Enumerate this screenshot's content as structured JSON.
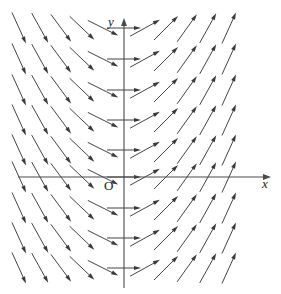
{
  "figure": {
    "title": "",
    "background_color": "#ffffff",
    "stroke_color": "#3a3a3a",
    "axis_color": "#4a4a4a",
    "width": 281,
    "height": 294
  },
  "axes": {
    "x_label": "x",
    "y_label": "y",
    "origin_label": "O",
    "x_axis_y_px": 177,
    "y_axis_x_px": 124,
    "x_axis_start_px": 18,
    "x_axis_end_px": 271,
    "y_axis_top_px": 18,
    "y_axis_bottom_px": 288
  },
  "chart_data": {
    "type": "scatter",
    "subtype": "direction-field",
    "title": "",
    "xlabel": "x",
    "ylabel": "y",
    "grid": false,
    "legend": null,
    "slope_rule": "dy/dx = x",
    "x": [
      -5,
      -4,
      -3,
      -2,
      -1,
      0,
      1,
      2,
      3,
      4,
      5
    ],
    "y": [
      5,
      4,
      3,
      2,
      1,
      0,
      -1,
      -2,
      -3,
      -4,
      -5
    ],
    "xlim": [
      -5.5,
      5.5
    ],
    "ylim": [
      -5.5,
      5.5
    ],
    "columns_px": [
      33,
      54,
      75,
      96,
      117,
      124,
      145,
      166,
      187,
      208,
      229,
      248
    ],
    "rows_px": [
      28,
      59,
      90,
      120,
      150,
      177,
      208,
      238,
      268
    ],
    "column_slopes": [
      -2.2,
      -1.8,
      -1.35,
      -0.95,
      -0.5,
      0.0,
      0.55,
      1.0,
      1.4,
      1.8,
      2.2
    ],
    "arrow_length_px": 34,
    "n_columns": 11,
    "n_rows": 9,
    "arrow_head_length_px": 7,
    "arrow_head_width_px": 4.2
  }
}
